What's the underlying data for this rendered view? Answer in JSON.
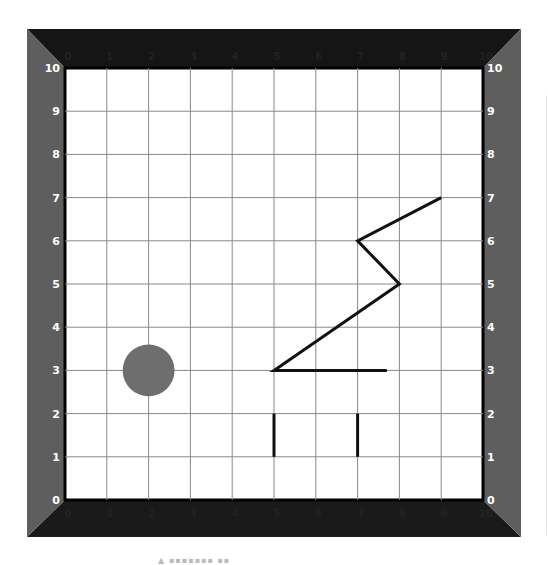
{
  "grid": {
    "x_min": 0,
    "x_max": 10,
    "y_min": 0,
    "y_max": 10,
    "x_ticks": [
      "0",
      "1",
      "2",
      "3",
      "4",
      "5",
      "6",
      "7",
      "8",
      "9",
      "10"
    ],
    "y_ticks": [
      "0",
      "1",
      "2",
      "3",
      "4",
      "5",
      "6",
      "7",
      "8",
      "9",
      "10"
    ],
    "grid_color": "#888888",
    "frame_top_color": "#151515",
    "frame_side_color": "#5e5e5e",
    "top_tick_color": "#222222",
    "side_tick_color": "#ffffff"
  },
  "shapes": {
    "circle": {
      "cx": 2,
      "cy": 3,
      "r": 0.62,
      "fill": "#6e6e6e"
    },
    "polyline": {
      "points": [
        [
          7.7,
          3
        ],
        [
          5,
          3
        ],
        [
          8,
          5
        ],
        [
          7,
          6
        ],
        [
          9,
          7
        ]
      ],
      "stroke": "#111111"
    },
    "segments": [
      {
        "x1": 5,
        "y1": 1,
        "x2": 5,
        "y2": 2
      },
      {
        "x1": 7,
        "y1": 1,
        "x2": 7,
        "y2": 2
      }
    ]
  },
  "caption": {
    "text": "▲ ▪▪▪▪▪▪▪ ▪▪"
  }
}
